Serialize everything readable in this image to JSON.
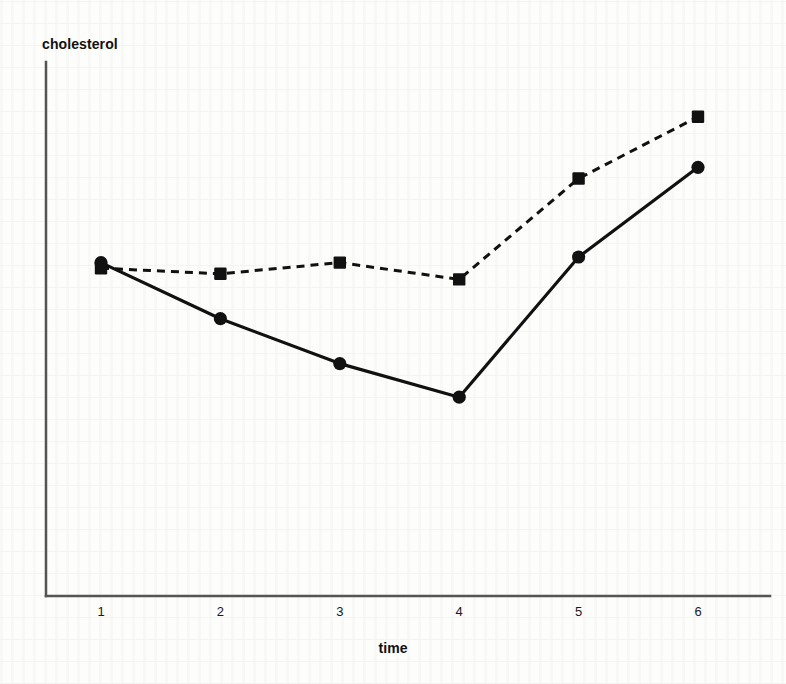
{
  "figure": {
    "name": "cholesterol-vs-time-line-chart",
    "background_color": "#fdfdfc",
    "ink_color": "#111111"
  },
  "chart_data": {
    "type": "line",
    "title": "",
    "subtitle": "",
    "xlabel": "time",
    "ylabel": "cholesterol",
    "x": [
      1,
      2,
      3,
      4,
      5,
      6
    ],
    "categories": [
      "1",
      "2",
      "3",
      "4",
      "5",
      "6"
    ],
    "xtick_labels": [
      "1",
      "2",
      "3",
      "4",
      "5",
      "6"
    ],
    "ytick_labels": [],
    "xlim": [
      0.6,
      6.4
    ],
    "ylim": [
      0,
      100
    ],
    "grid": false,
    "legend": "none",
    "annotations": [],
    "series": [
      {
        "name": "dashed-square-series",
        "marker": "square",
        "line_style": "dashed",
        "color": "#111111",
        "values": [
          66,
          65,
          67,
          64,
          82,
          93
        ]
      },
      {
        "name": "solid-circle-series",
        "marker": "circle",
        "line_style": "solid",
        "color": "#111111",
        "values": [
          67,
          57,
          49,
          43,
          68,
          84
        ]
      }
    ]
  },
  "axes": {
    "x_axis_label": "time",
    "y_axis_label": "cholesterol",
    "axis_color": "#3a3a3a"
  }
}
